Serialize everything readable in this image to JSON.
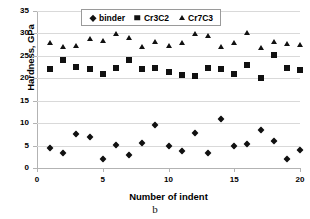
{
  "chart_data": {
    "type": "scatter",
    "title": "",
    "xlabel": "Number of indent",
    "ylabel": "Hardness, GPa",
    "xlim": [
      0,
      20
    ],
    "ylim": [
      0,
      35
    ],
    "xticks": [
      0,
      5,
      10,
      15,
      20
    ],
    "yticks": [
      0,
      5,
      10,
      15,
      20,
      25,
      30,
      35
    ],
    "grid": "horizontal",
    "legend_position": "top-center",
    "x": [
      1,
      2,
      3,
      4,
      5,
      6,
      7,
      8,
      9,
      10,
      11,
      12,
      13,
      14,
      15,
      16,
      17,
      18,
      19,
      20
    ],
    "series": [
      {
        "name": "binder",
        "marker": "diamond",
        "color": "#111111",
        "values": [
          4.5,
          3.3,
          7.6,
          6.9,
          2.1,
          5.1,
          3.0,
          5.5,
          9.5,
          4.9,
          3.7,
          7.7,
          3.4,
          10.9,
          4.8,
          5.3,
          8.4,
          6.1,
          1.9,
          4.1
        ]
      },
      {
        "name": "Cr3C2",
        "marker": "square",
        "color": "#111111",
        "values": [
          22.0,
          24.0,
          22.5,
          22.0,
          21.0,
          22.3,
          24.0,
          22.0,
          22.4,
          21.5,
          20.8,
          20.5,
          22.3,
          22.0,
          21.0,
          22.9,
          20.0,
          25.2,
          22.3,
          21.9
        ]
      },
      {
        "name": "Cr7C3",
        "marker": "triangle",
        "color": "#111111",
        "values": [
          27.9,
          26.9,
          27.2,
          28.8,
          28.3,
          29.9,
          28.9,
          26.9,
          28.2,
          27.2,
          27.8,
          29.9,
          29.4,
          26.9,
          27.8,
          30.1,
          26.8,
          28.2,
          27.7,
          27.4
        ]
      }
    ]
  },
  "legend": {
    "items": [
      {
        "label": "binder",
        "marker": "diamond"
      },
      {
        "label": "Cr3C2",
        "marker": "square"
      },
      {
        "label": "Cr7C3",
        "marker": "triangle"
      }
    ]
  },
  "caption": "b"
}
